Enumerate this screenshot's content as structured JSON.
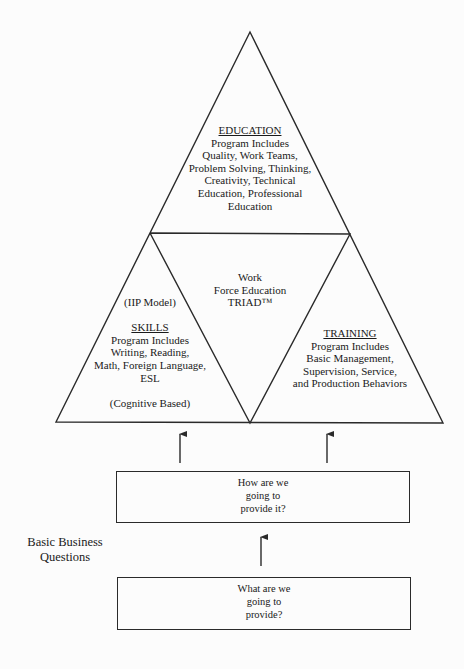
{
  "figure": {
    "colors": {
      "background": "#fcfcfc",
      "stroke": "#2a2a2a",
      "text": "#1a1a1a"
    },
    "triad": {
      "education": {
        "heading": "EDUCATION",
        "lines": [
          "Program Includes",
          "Quality, Work Teams,",
          "Problem Solving, Thinking,",
          "Creativity, Technical",
          "Education, Professional",
          "Education"
        ]
      },
      "center": {
        "lines": [
          "Work",
          "Force Education",
          "TRIAD™"
        ]
      },
      "skills": {
        "model_note": "(IIP Model)",
        "heading": "SKILLS",
        "lines": [
          "Program Includes",
          "Writing, Reading,",
          "Math, Foreign Language,",
          "ESL"
        ],
        "footer_note": "(Cognitive Based)"
      },
      "training": {
        "heading": "TRAINING",
        "lines": [
          "Program Includes",
          "Basic Management,",
          "Supervision, Service,",
          "and Production Behaviors"
        ]
      }
    },
    "questions": {
      "side_label": [
        "Basic Business",
        "Questions"
      ],
      "how_box": {
        "lines": [
          "How are we",
          "going to",
          "provide it?"
        ]
      },
      "what_box": {
        "lines": [
          "What are we",
          "going to",
          "provide?"
        ]
      }
    }
  }
}
